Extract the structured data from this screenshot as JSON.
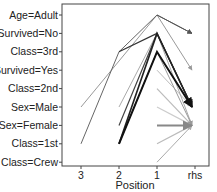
{
  "chart_data": {
    "type": "line",
    "subtype": "parallel-coordinates (association rules)",
    "title": "",
    "xlabel": "Position",
    "ylabel": "",
    "x_ticks": [
      "3",
      "2",
      "1",
      "rhs"
    ],
    "y_ticks": [
      "Age=Adult",
      "Survived=No",
      "Class=3rd",
      "Survived=Yes",
      "Class=2nd",
      "Sex=Male",
      "Sex=Female",
      "Class=1st",
      "Class=Crew"
    ],
    "grid": false,
    "legend": null,
    "rules": [
      {
        "path": [
          null,
          null,
          "Age=Adult",
          "Survived=No"
        ],
        "shade": "#555555",
        "width": 1
      },
      {
        "path": [
          null,
          "Class=3rd",
          "Survived=No",
          "Sex=Male"
        ],
        "shade": "#333333",
        "width": 1.2
      },
      {
        "path": [
          "Class=1st",
          "Class=3rd",
          "Age=Adult",
          "Survived=No"
        ],
        "shade": "#666666",
        "width": 1
      },
      {
        "path": [
          null,
          "Class=1st",
          "Class=3rd",
          "Sex=Male"
        ],
        "shade": "#111111",
        "width": 2
      },
      {
        "path": [
          null,
          "Class=1st",
          "Survived=No",
          "Sex=Male"
        ],
        "shade": "#222222",
        "width": 1.6
      },
      {
        "path": [
          "Sex=Male",
          null,
          "Age=Adult",
          "Survived=Yes"
        ],
        "shade": "#999999",
        "width": 1
      },
      {
        "path": [
          null,
          "Sex=Female",
          "Survived=No",
          "Sex=Male"
        ],
        "shade": "#444444",
        "width": 1.2
      },
      {
        "path": [
          null,
          "Class=1st",
          "Class=3rd",
          "Sex=Male"
        ],
        "shade": "#777777",
        "width": 1
      },
      {
        "path": [
          null,
          "Sex=Male",
          "Survived=No",
          "Sex=Female"
        ],
        "shade": "#aaaaaa",
        "width": 1
      },
      {
        "path": [
          null,
          null,
          "Class=2nd",
          "Sex=Female"
        ],
        "shade": "#bbbbbb",
        "width": 1.2
      },
      {
        "path": [
          null,
          null,
          "Class=3rd",
          "Sex=Female"
        ],
        "shade": "#999999",
        "width": 1
      },
      {
        "path": [
          null,
          null,
          "Sex=Male",
          "Sex=Female"
        ],
        "shade": "#cccccc",
        "width": 1.2
      },
      {
        "path": [
          null,
          null,
          "Sex=Female",
          "Sex=Female"
        ],
        "shade": "#888888",
        "width": 2
      },
      {
        "path": [
          null,
          null,
          "Class=1st",
          "Sex=Female"
        ],
        "shade": "#bbbbbb",
        "width": 1.2
      },
      {
        "path": [
          null,
          null,
          "Class=Crew",
          "Sex=Female"
        ],
        "shade": "#aaaaaa",
        "width": 1
      },
      {
        "path": [
          null,
          null,
          "Survived=Yes",
          "Sex=Male"
        ],
        "shade": "#bbbbbb",
        "width": 1
      }
    ]
  }
}
